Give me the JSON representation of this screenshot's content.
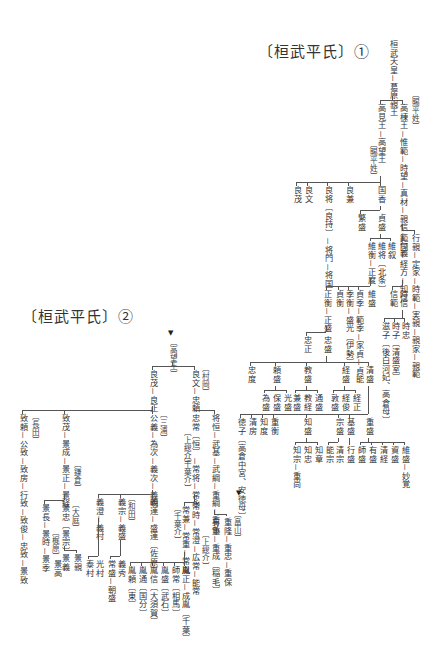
{
  "titles": {
    "part1": "〔桓武平氏〕①",
    "part2": "〔桓武平氏〕②"
  },
  "part1": {
    "root": "桓武天皇－葛原親王",
    "branch_a": "高見王－高望王",
    "branch_a_note": "〔賜平姓〕",
    "branch_b": "高棟王－惟範－時望－真材－親信－行義",
    "branch_b_note": "〔賜平姓〕",
    "takamochi_children": {
      "yoshishige": "良茂",
      "yoshifumi": "良文",
      "yoshimochi": "良将〔良持〕－将門－将国",
      "yoshikane": "良兼",
      "kunika": "国香"
    },
    "kunika_children": {
      "hanmori": "繁盛",
      "sadamori": "貞盛"
    },
    "sadamori_children": {
      "korehira": "維衡－正度",
      "koretoki": "維将〔北条〕",
      "korenori": "維叙"
    },
    "masanori_children": {
      "masahira": "正衡－正盛",
      "sadahira": "貞衡",
      "suehira": "季衡－盛光〔伊勢〕",
      "sadasue": "貞季－範季－家貞－貞能",
      "koremori": "維盛"
    },
    "masamori_children": {
      "tadamasa": "忠正",
      "tadamori": "忠盛"
    },
    "yukiyoshi_children": {
      "norikuni": "範国－経方－知信",
      "yukinori": "行親－定家－時範－実親－親家－親範"
    },
    "tomonobu_children": {
      "nobunori": "信範",
      "tokinobu": "時信"
    },
    "tokinobu_children": {
      "shigeko": "滋子〔後白河妃、高倉母〕",
      "tokiko": "時子〔清盛室〕",
      "tokitada": "時忠"
    },
    "tadamori_children": {
      "tadanori": "忠度",
      "yorimori": "頼盛",
      "norimori": "教盛",
      "tsunemori": "経盛",
      "kiyomori": "清盛"
    },
    "yorimori_children": [
      "為盛",
      "保盛",
      "光盛"
    ],
    "norimori_children": [
      "兼盛",
      "教経",
      "通盛"
    ],
    "tsunemori_children": [
      "敦盛",
      "経俊",
      "経正"
    ],
    "kiyomori_children": {
      "tokuko": "徳子〔高倉中宮、安徳母〕",
      "kiyofusa": "清房",
      "tomonori": "知度",
      "shigehira": "重衡",
      "tomomori": "知盛",
      "munemori": "宗盛",
      "motomori": "基盛",
      "shigemori": "重盛"
    },
    "tomomori_children": [
      "知宗－重尚",
      "知忠",
      "知章"
    ],
    "munemori_children": [
      "能宗",
      "清宗"
    ],
    "motomori_children": [
      "行盛"
    ],
    "shigemori_children": [
      "維盛",
      "資盛",
      "清経",
      "有盛",
      "師盛"
    ],
    "extra": "忠房",
    "shigemori_tail": "維盛－妙覚"
  },
  "part2": {
    "root": "〔高望王〕",
    "yoshishige_line": "良茂－良正",
    "yoshifumi_line": "良文－忠頼",
    "yoshifumi_note": "〔村岡〕",
    "tadayori_children": {
      "tsunemasa_a": "将恒－武基－武綱－重綱－重弘",
      "tadatsune": "忠常〔恒〕－常将－常永",
      "tadatsune_note1": "〔上総介〕",
      "tadatsune_note2": "〔千葉介〕"
    },
    "shigehiro_children": {
      "shigetaka": "重隆－重忠－重保",
      "shigetaka_note": "〔畠山〕",
      "aritsune": "有重－重成〔稲毛〕"
    },
    "tsunenaga_children": {
      "tsunetoki": "常時－常澄－広常－能常",
      "tsunetoki_note": "〔上総介〕",
      "tsunekane": "常兼－常重－常胤"
    },
    "tsunetane_children": [
      "胤正－成胤〔千葉〕",
      "師常〔相馬〕",
      "胤盛〔武石〕",
      "胤信〔大須賀〕",
      "胤通〔国分〕",
      "胤頼〔東〕"
    ],
    "yoshimasa_children": {
      "tadamichi": "致頼－公致－致房－行致－致俊－忠致－景致",
      "tadamichi_note": "〔長田〕",
      "tadamochi": "致茂－景成－景正－景経",
      "tadamochi_note": "〔鎌倉〕",
      "kimiyoshi": "公義－為次－義次－義明",
      "kimiyoshi_note": "〔三浦〕"
    },
    "kagetsune_children": {
      "kagenaga": "景長－景時－景季",
      "kagenaga_note": "〔梶原〕",
      "kagetada": "景忠〔景宗〕",
      "kagetada_note": "〔大庭〕",
      "kagetaka": "景高"
    },
    "kagetada_children": [
      "景義",
      "景親"
    ],
    "yoshiaki_children": {
      "yoshizumi": "義澄－義村",
      "yoshimune": "義宗－義盛",
      "yoshimune_note": "〔和田〕",
      "yoshitsura": "義連－盛連〔佐原〕"
    },
    "yoshimura_children": [
      "泰村",
      "光村"
    ],
    "yoshimori_children": [
      "常盛－朝盛",
      "義秀"
    ]
  }
}
